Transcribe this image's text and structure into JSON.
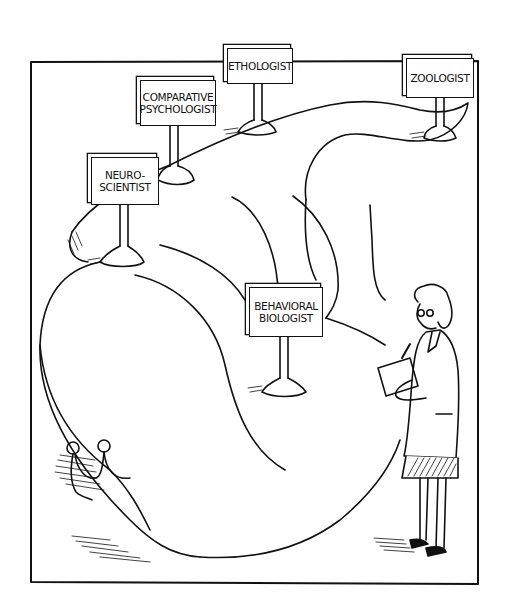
{
  "illustration": {
    "subject": "Giant snail with career signposts and a woman scientist taking notes on a clipboard",
    "colors": {
      "ink": "#111111",
      "paper": "#ffffff"
    },
    "signs": [
      {
        "id": "ethologist",
        "lines": [
          "ETHOLOGIST"
        ]
      },
      {
        "id": "zoologist",
        "lines": [
          "ZOOLOGIST"
        ]
      },
      {
        "id": "comparative-psychologist",
        "lines": [
          "COMPARATIVE",
          "PSYCHOLOGIST"
        ]
      },
      {
        "id": "neuroscientist",
        "lines": [
          "NEURO-",
          "SCIENTIST"
        ]
      },
      {
        "id": "behavioral-biologist",
        "lines": [
          "BEHAVIORAL",
          "BIOLOGIST"
        ]
      }
    ]
  }
}
